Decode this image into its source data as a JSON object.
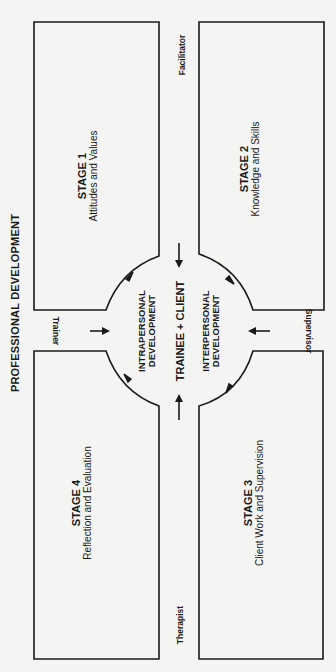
{
  "diagram": {
    "title": "PROFESSIONAL DEVELOPMENT",
    "center": {
      "main": "TRAINEE + CLIENT",
      "left_line1": "INTRAPERSONAL",
      "left_line2": "DEVELOPMENT",
      "right_line1": "INTERPERSONAL",
      "right_line2": "DEVELOPMENT"
    },
    "roles": {
      "trainer": "Trainer",
      "facilitator": "Facilitator",
      "supervisor": "Supervisor",
      "therapist": "Therapist"
    },
    "stages": [
      {
        "number": "STAGE 1",
        "label": "Attitudes and Values"
      },
      {
        "number": "STAGE 2",
        "label": "Knowledge and Skills"
      },
      {
        "number": "STAGE 3",
        "label": "Client Work and Supervision"
      },
      {
        "number": "STAGE 4",
        "label": "Reflection and Evaluation"
      }
    ],
    "colors": {
      "line": "#1a1a1a",
      "background": "#f4f4f2"
    }
  }
}
